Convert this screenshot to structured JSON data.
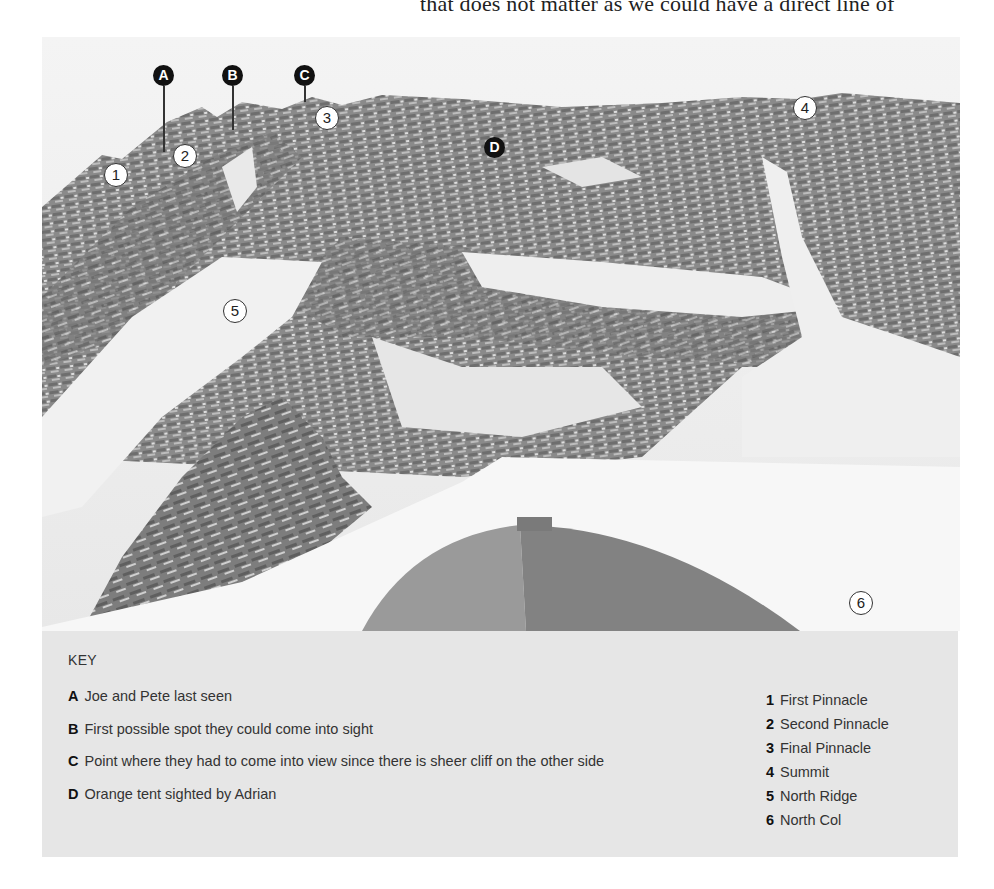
{
  "page": {
    "top_text": "that does not matter as we could have a direct line of"
  },
  "photo": {
    "markers_letters": [
      {
        "id": "A",
        "label": "A"
      },
      {
        "id": "B",
        "label": "B"
      },
      {
        "id": "C",
        "label": "C"
      },
      {
        "id": "D",
        "label": "D"
      }
    ],
    "markers_numbers": [
      {
        "id": "1",
        "label": "1"
      },
      {
        "id": "2",
        "label": "2"
      },
      {
        "id": "3",
        "label": "3"
      },
      {
        "id": "4",
        "label": "4"
      },
      {
        "id": "5",
        "label": "5"
      },
      {
        "id": "6",
        "label": "6"
      }
    ]
  },
  "key": {
    "title": "KEY",
    "letters": [
      {
        "letter": "A",
        "text": "Joe and Pete last seen"
      },
      {
        "letter": "B",
        "text": "First possible spot they could come into sight"
      },
      {
        "letter": "C",
        "text": "Point where they had to come into view since there is sheer cliff on the other side"
      },
      {
        "letter": "D",
        "text": "Orange tent sighted by Adrian"
      }
    ],
    "numbers": [
      {
        "num": "1",
        "text": "First Pinnacle"
      },
      {
        "num": "2",
        "text": "Second Pinnacle"
      },
      {
        "num": "3",
        "text": "Final Pinnacle"
      },
      {
        "num": "4",
        "text": "Summit"
      },
      {
        "num": "5",
        "text": "North Ridge"
      },
      {
        "num": "6",
        "text": "North Col"
      }
    ]
  }
}
